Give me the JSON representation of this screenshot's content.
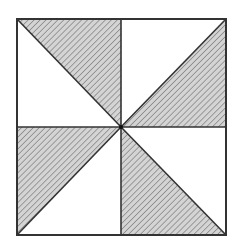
{
  "diagram": {
    "type": "pinwheel-square",
    "colors": {
      "background": "#ffffff",
      "stroke": "#333333",
      "hatch_fill": "#d4d4d4",
      "hatch_line": "#8a8a8a"
    },
    "square": {
      "x1": 17,
      "y1": 19,
      "x2": 226,
      "y2": 235
    },
    "center": {
      "x": 121,
      "y": 127
    },
    "shaded_triangles": [
      {
        "name": "top-left",
        "points": "17,19 121,19 121,127"
      },
      {
        "name": "top-right",
        "points": "226,19 226,127 121,127"
      },
      {
        "name": "bottom-left",
        "points": "17,127 17,235 121,127"
      },
      {
        "name": "bottom-right",
        "points": "121,127 121,235 226,235"
      }
    ],
    "lines": [
      {
        "name": "vertical-midline",
        "x1": 121,
        "y1": 19,
        "x2": 121,
        "y2": 235
      },
      {
        "name": "horizontal-midline",
        "x1": 17,
        "y1": 127,
        "x2": 226,
        "y2": 127
      },
      {
        "name": "diagonal-top-left",
        "x1": 17,
        "y1": 19,
        "x2": 121,
        "y2": 127
      },
      {
        "name": "diagonal-top-right",
        "x1": 226,
        "y1": 19,
        "x2": 121,
        "y2": 127
      },
      {
        "name": "diagonal-bottom-left",
        "x1": 17,
        "y1": 235,
        "x2": 121,
        "y2": 127
      },
      {
        "name": "diagonal-bottom-right",
        "x1": 121,
        "y1": 127,
        "x2": 226,
        "y2": 235
      }
    ]
  }
}
